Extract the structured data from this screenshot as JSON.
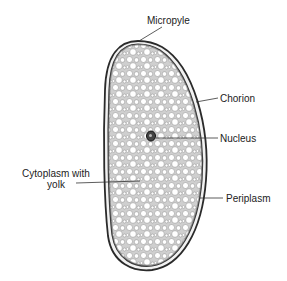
{
  "diagram": {
    "labels": {
      "micropyle": "Micropyle",
      "chorion": "Chorion",
      "nucleus": "Nucleus",
      "cytoplasm_line1": "Cytoplasm with",
      "cytoplasm_line2": "yolk",
      "periplasm": "Periplasm"
    },
    "colors": {
      "outline": "#2a2a2a",
      "fill": "#d9d9d9",
      "yolk": "#ffffff",
      "text": "#222222"
    }
  }
}
